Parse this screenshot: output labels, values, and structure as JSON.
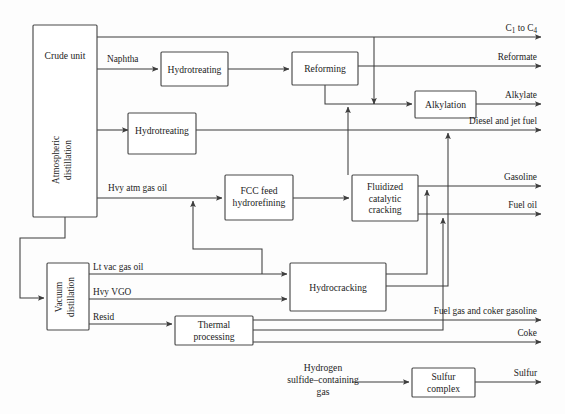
{
  "diagram": {
    "stroke_color": "#3d3d3d",
    "box_stroke_color": "#4a4a4a",
    "text_color": "#1c1c1c",
    "background": "#fdfdfd",
    "units": {
      "crude_unit": "Crude unit",
      "atmospheric_distillation_l1": "Atmospheric",
      "atmospheric_distillation_l2": "distillation",
      "vacuum_distillation_l1": "Vacuum",
      "vacuum_distillation_l2": "distillation",
      "hydrotreating_naphtha": "Hydrotreating",
      "hydrotreating_distillate": "Hydrotreating",
      "reforming": "Reforming",
      "alkylation": "Alkylation",
      "fcc_feed_hydrorefining_l1": "FCC feed",
      "fcc_feed_hydrorefining_l2": "hydrorefining",
      "fcc_l1": "Fluidized",
      "fcc_l2": "catalytic",
      "fcc_l3": "cracking",
      "hydrocracking": "Hydrocracking",
      "thermal_processing_l1": "Thermal",
      "thermal_processing_l2": "processing",
      "sulfur_complex_l1": "Sulfur",
      "sulfur_complex_l2": "complex"
    },
    "stream_labels": {
      "naphtha": "Naphtha",
      "hvy_atm_gas_oil": "Hvy atm gas oil",
      "lt_vac_gas_oil": "Lt vac gas oil",
      "hvy_vgo": "Hvy VGO",
      "resid": "Resid",
      "h2s_gas_l1": "Hydrogen",
      "h2s_gas_l2": "sulfide–containing",
      "h2s_gas_l3": "gas"
    },
    "products": {
      "c1_to_c4_pre": "C",
      "c1_to_c4_sub1": "1",
      "c1_to_c4_mid": " to C",
      "c1_to_c4_sub2": "4",
      "reformate": "Reformate",
      "alkylate": "Alkylate",
      "diesel_jet": "Diesel and jet fuel",
      "gasoline": "Gasoline",
      "fuel_oil": "Fuel oil",
      "fuel_gas_coker_gasoline": "Fuel gas and coker gasoline",
      "coke": "Coke",
      "sulfur": "Sulfur"
    }
  }
}
